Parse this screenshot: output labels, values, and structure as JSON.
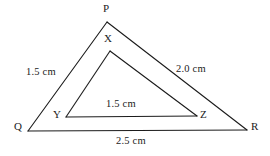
{
  "figure": {
    "type": "geometry-diagram",
    "background_color": "#ffffff",
    "stroke_color": "#1b1b1b",
    "stroke_width": 1.1,
    "width": 270,
    "height": 156
  },
  "outer_triangle": {
    "name": "PQR",
    "vertices": [
      {
        "label": "P",
        "x": 107,
        "y": 22
      },
      {
        "label": "Q",
        "x": 28,
        "y": 131
      },
      {
        "label": "R",
        "x": 247,
        "y": 130
      }
    ],
    "sides": [
      {
        "from": "P",
        "to": "Q",
        "measure": "1.5 cm"
      },
      {
        "from": "P",
        "to": "R",
        "measure": "2.0 cm"
      },
      {
        "from": "Q",
        "to": "R",
        "measure": "2.5 cm"
      }
    ]
  },
  "inner_triangle": {
    "name": "XYZ",
    "vertices": [
      {
        "label": "X",
        "x": 110,
        "y": 51
      },
      {
        "label": "Y",
        "x": 66,
        "y": 117
      },
      {
        "label": "Z",
        "x": 197,
        "y": 116
      }
    ],
    "sides": [
      {
        "from": "X",
        "to": "Y",
        "measure": ""
      },
      {
        "from": "X",
        "to": "Z",
        "measure": ""
      },
      {
        "from": "Y",
        "to": "Z",
        "measure": "1.5 cm"
      }
    ]
  },
  "labels": {
    "vertex_P": "P",
    "vertex_Q": "Q",
    "vertex_R": "R",
    "vertex_X": "X",
    "vertex_Y": "Y",
    "vertex_Z": "Z",
    "measure_PQ": "1.5 cm",
    "measure_PR": "2.0 cm",
    "measure_YZ": "1.5 cm",
    "measure_QR": "2.5 cm"
  }
}
